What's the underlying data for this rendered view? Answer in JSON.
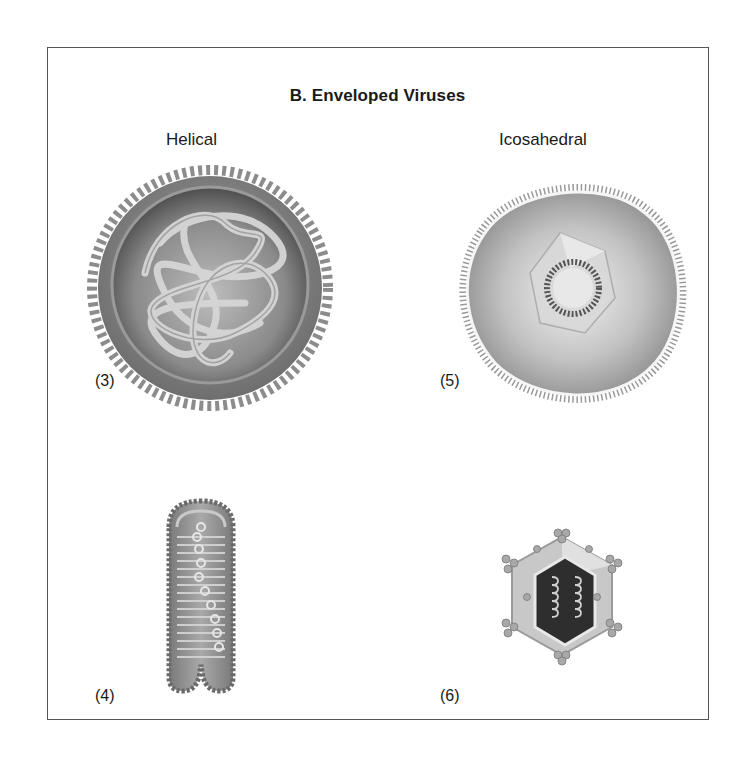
{
  "figure": {
    "title": "B. Enveloped Viruses",
    "columns": [
      {
        "label": "Helical"
      },
      {
        "label": "Icosahedral"
      }
    ],
    "panels": [
      {
        "number": "(3)",
        "type": "helical",
        "shape": "spherical enveloped virus with tangled helical nucleocapsid"
      },
      {
        "number": "(4)",
        "type": "helical",
        "shape": "bullet-shaped enveloped virus with coiled nucleocapsid"
      },
      {
        "number": "(5)",
        "type": "icosahedral",
        "shape": "enveloped virus with icosahedral capsid inside spiked envelope"
      },
      {
        "number": "(6)",
        "type": "icosahedral",
        "shape": "icosahedral capsid cutaway with helical nucleic acid and capsomer clusters"
      }
    ],
    "colors": {
      "frame": "#555555",
      "envelope": "#8a8a8a",
      "interior_dark": "#4a4a4a",
      "strand": "#c9c9c9"
    }
  }
}
